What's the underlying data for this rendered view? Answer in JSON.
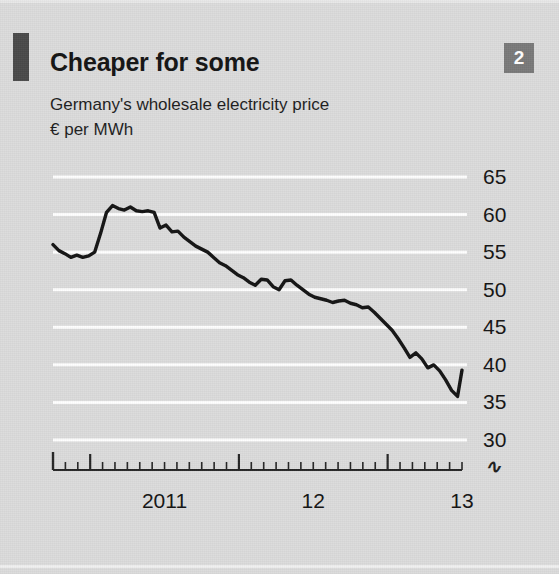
{
  "header": {
    "badge_number": "2",
    "title": "Cheaper for some",
    "subtitle_line1": "Germany's wholesale electricity price",
    "subtitle_line2": "€ per MWh",
    "accent_color": "#4a4a4a",
    "badge_color": "#7a7a7a"
  },
  "chart_data": {
    "type": "line",
    "title": "Cheaper for some",
    "subtitle": "Germany's wholesale electricity price",
    "xlabel": "",
    "ylabel": "€ per MWh",
    "ylim": [
      30,
      65
    ],
    "ytick_labels": [
      "65",
      "60",
      "55",
      "50",
      "45",
      "40",
      "35",
      "30"
    ],
    "yticks": [
      65,
      60,
      55,
      50,
      45,
      40,
      35,
      30
    ],
    "axis_break_below": "30",
    "grid": true,
    "grid_color": "#ffffff",
    "legend": "none",
    "line_color": "#141414",
    "xtick_labels": [
      "2011",
      "12",
      "13"
    ],
    "xtick_positions": [
      2011.0,
      2012.0,
      2013.0
    ],
    "x_minor_ticks": "monthly",
    "x_range": [
      2010.75,
      2013.5
    ],
    "series": [
      {
        "name": "Germany wholesale electricity price",
        "x": [
          2010.75,
          2010.79,
          2010.83,
          2010.87,
          2010.91,
          2010.95,
          2010.99,
          2011.03,
          2011.07,
          2011.11,
          2011.15,
          2011.19,
          2011.23,
          2011.27,
          2011.31,
          2011.35,
          2011.39,
          2011.43,
          2011.47,
          2011.51,
          2011.55,
          2011.59,
          2011.63,
          2011.67,
          2011.71,
          2011.75,
          2011.79,
          2011.83,
          2011.87,
          2011.91,
          2011.95,
          2011.99,
          2012.03,
          2012.07,
          2012.11,
          2012.15,
          2012.19,
          2012.23,
          2012.27,
          2012.31,
          2012.35,
          2012.39,
          2012.43,
          2012.47,
          2012.51,
          2012.55,
          2012.59,
          2012.63,
          2012.67,
          2012.71,
          2012.75,
          2012.79,
          2012.83,
          2012.87,
          2012.91,
          2012.95,
          2012.99,
          2013.03,
          2013.07,
          2013.11,
          2013.15,
          2013.19,
          2013.23,
          2013.27,
          2013.31,
          2013.35,
          2013.39,
          2013.43,
          2013.47
        ],
        "y": [
          56.0,
          55.2,
          54.8,
          54.3,
          54.6,
          54.3,
          54.5,
          55.0,
          57.5,
          60.3,
          61.2,
          60.8,
          60.6,
          61.0,
          60.5,
          60.4,
          60.5,
          60.3,
          58.2,
          58.6,
          57.7,
          57.8,
          57.0,
          56.4,
          55.8,
          55.4,
          55.0,
          54.3,
          53.6,
          53.2,
          52.6,
          52.0,
          51.6,
          51.0,
          50.6,
          51.4,
          51.3,
          50.4,
          50.0,
          51.2,
          51.3,
          50.6,
          50.0,
          49.4,
          49.0,
          48.8,
          48.6,
          48.3,
          48.5,
          48.6,
          48.2,
          48.0,
          47.6,
          47.7,
          47.0,
          46.2,
          45.4,
          44.6,
          43.5,
          42.3,
          41.0,
          41.6,
          40.8,
          39.6,
          40.0,
          39.2,
          38.0,
          36.6,
          35.8
        ],
        "last_value": 39.3
      }
    ],
    "notable": {
      "start_value": 56.0,
      "peak_value": 61.2,
      "trough_value": 35.8,
      "end_value": 39.3
    }
  }
}
